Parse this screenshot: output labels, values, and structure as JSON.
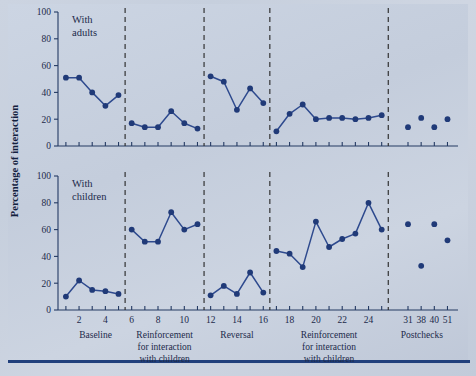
{
  "figure": {
    "ylabel": "Percentage of interaction",
    "panels": [
      {
        "id": "adults",
        "title_line1": "With",
        "title_line2": "adults"
      },
      {
        "id": "children",
        "title_line1": "With",
        "title_line2": "children"
      }
    ],
    "y_ticks": [
      "0",
      "20",
      "40",
      "60",
      "80",
      "100"
    ],
    "x_ticks": [
      "2",
      "4",
      "6",
      "8",
      "10",
      "12",
      "14",
      "16",
      "18",
      "20",
      "22",
      "24",
      "31",
      "38",
      "40",
      "51"
    ],
    "phase_labels": [
      {
        "line1": "Baseline",
        "line2": "",
        "line3": ""
      },
      {
        "line1": "Reinforcement",
        "line2": "for interaction",
        "line3": "with children"
      },
      {
        "line1": "Reversal",
        "line2": "",
        "line3": ""
      },
      {
        "line1": "Reinforcement",
        "line2": "for interaction",
        "line3": "with children"
      },
      {
        "line1": "Postchecks",
        "line2": "",
        "line3": ""
      }
    ],
    "colors": {
      "series": "#2e4a8e",
      "marker": "#203a78",
      "axis": "#243a63",
      "divider": "#2c2c2c",
      "background": "#c9d2e0",
      "rule": "#21407c"
    }
  },
  "chart_data": {
    "type": "line",
    "xlabel": "Sessions",
    "ylabel": "Percentage of interaction",
    "ylim": [
      0,
      100
    ],
    "xlim": [
      0.3,
      18.2
    ],
    "grid": false,
    "legend": "none",
    "x_tick_values": [
      2,
      4,
      6,
      8,
      10,
      12,
      14,
      16,
      18,
      20,
      22,
      24,
      31,
      38,
      40,
      51
    ],
    "phase_boundaries": [
      5.5,
      11.5,
      16.5,
      25.5
    ],
    "phases": [
      {
        "name": "Baseline",
        "sessions": [
          1,
          2,
          3,
          4,
          5
        ]
      },
      {
        "name": "Reinforcement for interaction with children",
        "sessions": [
          6,
          7,
          8,
          9,
          10,
          11
        ]
      },
      {
        "name": "Reversal",
        "sessions": [
          12,
          13,
          14,
          15,
          16
        ]
      },
      {
        "name": "Reinforcement for interaction with children",
        "sessions": [
          17,
          18,
          19,
          20,
          21,
          22,
          23,
          24,
          25
        ]
      },
      {
        "name": "Postchecks",
        "sessions": [
          31,
          38,
          40,
          51
        ]
      }
    ],
    "panels": [
      {
        "name": "With adults",
        "segments": [
          {
            "phase": "Baseline",
            "x": [
              1,
              2,
              3,
              4,
              5
            ],
            "y": [
              51,
              51,
              40,
              30,
              38
            ]
          },
          {
            "phase": "Reinforcement for interaction with children",
            "x": [
              6,
              7,
              8,
              9,
              10,
              11
            ],
            "y": [
              17,
              14,
              14,
              26,
              17,
              13
            ]
          },
          {
            "phase": "Reversal",
            "x": [
              12,
              13,
              14,
              15,
              16
            ],
            "y": [
              52,
              48,
              27,
              43,
              32
            ]
          },
          {
            "phase": "Reinforcement for interaction with children",
            "x": [
              17,
              18,
              19,
              20,
              21,
              22,
              23,
              24,
              25
            ],
            "y": [
              11,
              24,
              31,
              20,
              21,
              21,
              20,
              21,
              23
            ]
          },
          {
            "phase": "Postchecks",
            "x": [
              31,
              38,
              40,
              51
            ],
            "y": [
              14,
              21,
              14,
              20
            ],
            "connected": false
          }
        ]
      },
      {
        "name": "With children",
        "segments": [
          {
            "phase": "Baseline",
            "x": [
              1,
              2,
              3,
              4,
              5
            ],
            "y": [
              10,
              22,
              15,
              14,
              12
            ]
          },
          {
            "phase": "Reinforcement for interaction with children",
            "x": [
              6,
              7,
              8,
              9,
              10,
              11
            ],
            "y": [
              60,
              51,
              51,
              73,
              60,
              64
            ]
          },
          {
            "phase": "Reversal",
            "x": [
              12,
              13,
              14,
              15,
              16
            ],
            "y": [
              11,
              18,
              12,
              28,
              13
            ]
          },
          {
            "phase": "Reinforcement for interaction with children",
            "x": [
              17,
              18,
              19,
              20,
              21,
              22,
              23,
              24,
              25
            ],
            "y": [
              44,
              42,
              32,
              66,
              47,
              53,
              57,
              80,
              60
            ]
          },
          {
            "phase": "Postchecks",
            "x": [
              31,
              38,
              40,
              51
            ],
            "y": [
              64,
              33,
              64,
              52
            ],
            "connected": false
          }
        ]
      }
    ]
  }
}
